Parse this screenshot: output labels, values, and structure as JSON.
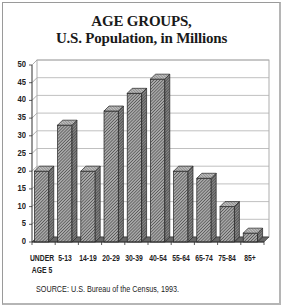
{
  "chart_data": {
    "type": "bar",
    "title": "AGE GROUPS,",
    "subtitle": "U.S. Population, in Millions",
    "categories": [
      "UNDER AGE 5",
      "5-13",
      "14-19",
      "20-29",
      "30-39",
      "40-54",
      "55-64",
      "65-74",
      "75-84",
      "85+"
    ],
    "category_lines": [
      [
        "UNDER",
        "AGE 5"
      ],
      [
        "5-13"
      ],
      [
        "14-19"
      ],
      [
        "20-29"
      ],
      [
        "30-39"
      ],
      [
        "40-54"
      ],
      [
        "55-64"
      ],
      [
        "65-74"
      ],
      [
        "75-84"
      ],
      [
        "85+"
      ]
    ],
    "series": [
      {
        "name": "Population (millions)",
        "values": [
          20,
          33,
          20,
          37,
          42,
          46,
          20,
          18,
          10,
          2.5
        ]
      }
    ],
    "xlabel": "",
    "ylabel": "",
    "ylim": [
      0,
      50
    ],
    "yticks": [
      0,
      5,
      10,
      15,
      20,
      25,
      30,
      35,
      40,
      45,
      50
    ],
    "grid": true,
    "legend": "none",
    "style": "3d-hatched-bars",
    "source": "SOURCE: U.S. Bureau of the Census, 1993."
  },
  "colors": {
    "bar_fill": "#8c8c8c",
    "bar_hatch": "#3a3a3a",
    "grid": "#b0b0b0",
    "axis": "#333333",
    "text": "#1a1a1a",
    "frame": "#9a9a9a"
  }
}
